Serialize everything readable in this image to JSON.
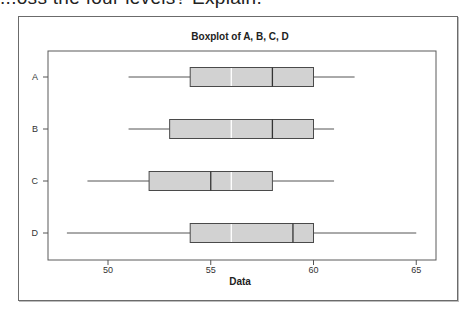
{
  "page": {
    "header_text": "...oss the four levels? Explain."
  },
  "chart_data": {
    "type": "boxplot",
    "orientation": "horizontal",
    "title": "Boxplot of A, B, C, D",
    "xlabel": "Data",
    "ylabel": "",
    "xlim": [
      47,
      66
    ],
    "xticks": [
      50,
      55,
      60,
      65
    ],
    "categories": [
      "A",
      "B",
      "C",
      "D"
    ],
    "grid": false,
    "legend": null,
    "series": [
      {
        "name": "A",
        "min": 51,
        "q1": 54,
        "median": 58,
        "mean": 56,
        "q3": 60,
        "max": 62
      },
      {
        "name": "B",
        "min": 51,
        "q1": 53,
        "median": 58,
        "mean": 56,
        "q3": 60,
        "max": 61
      },
      {
        "name": "C",
        "min": 49,
        "q1": 52,
        "median": 55,
        "mean": 56,
        "q3": 58,
        "max": 61
      },
      {
        "name": "D",
        "min": 48,
        "q1": 54,
        "median": 59,
        "mean": 56,
        "q3": 60,
        "max": 65
      }
    ],
    "colors": {
      "box_fill": "#d2d2d2",
      "box_stroke": "#4a4a4a",
      "mean_line": "#ffffff",
      "whisker": "#555555",
      "frame": "#6b6b6b"
    }
  }
}
